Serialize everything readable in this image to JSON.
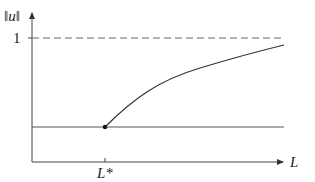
{
  "diagram": {
    "y_axis_label": "‖u‖",
    "x_axis_label": "L",
    "y_tick_label": "1",
    "x_tick_label": "L*",
    "elements": [
      {
        "name": "asymptote",
        "style": "dashed",
        "value": "1"
      },
      {
        "name": "lower-branch",
        "style": "solid horizontal"
      },
      {
        "name": "upper-branch",
        "style": "solid increasing concave curve starting at L*"
      },
      {
        "name": "bifurcation-point",
        "style": "filled dot at L*"
      }
    ],
    "colors": {
      "axis": "#444444",
      "curve": "#333333",
      "dashed": "#666666"
    }
  }
}
